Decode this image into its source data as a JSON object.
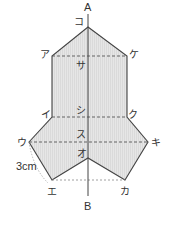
{
  "diagram": {
    "type": "net-of-figure-with-axis",
    "colors": {
      "fill": "#e4e4e4",
      "stroke": "#444444",
      "dashed": "#555555",
      "text": "#333333"
    },
    "axis": {
      "top_label": "A",
      "bottom_label": "B"
    },
    "points": {
      "a": "ア",
      "i": "イ",
      "u": "ウ",
      "e": "エ",
      "o": "オ",
      "ka": "カ",
      "ki": "キ",
      "ku": "ク",
      "ke": "ケ",
      "ko": "コ",
      "sa": "サ",
      "shi": "シ",
      "su": "ス"
    },
    "dimension": {
      "label": "3cm"
    }
  }
}
